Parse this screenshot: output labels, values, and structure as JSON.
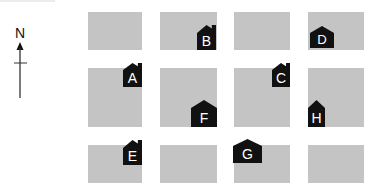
{
  "compass": {
    "label": "N",
    "direction": "north"
  },
  "colors": {
    "block": "#c4c4c4",
    "house": "#111111",
    "house_label": "#ffffff",
    "background": "#ffffff"
  },
  "blocks": [
    {
      "row": 1,
      "col": 1,
      "x": 88,
      "y": 12,
      "w": 54,
      "h": 38
    },
    {
      "row": 1,
      "col": 2,
      "x": 160,
      "y": 12,
      "w": 57,
      "h": 38
    },
    {
      "row": 1,
      "col": 3,
      "x": 234,
      "y": 12,
      "w": 56,
      "h": 38
    },
    {
      "row": 1,
      "col": 4,
      "x": 308,
      "y": 12,
      "w": 56,
      "h": 38
    },
    {
      "row": 2,
      "col": 1,
      "x": 88,
      "y": 68,
      "w": 54,
      "h": 59
    },
    {
      "row": 2,
      "col": 2,
      "x": 160,
      "y": 68,
      "w": 57,
      "h": 59
    },
    {
      "row": 2,
      "col": 3,
      "x": 234,
      "y": 68,
      "w": 56,
      "h": 59
    },
    {
      "row": 2,
      "col": 4,
      "x": 308,
      "y": 68,
      "w": 56,
      "h": 59
    },
    {
      "row": 3,
      "col": 1,
      "x": 88,
      "y": 145,
      "w": 54,
      "h": 38
    },
    {
      "row": 3,
      "col": 2,
      "x": 160,
      "y": 145,
      "w": 57,
      "h": 38
    },
    {
      "row": 3,
      "col": 3,
      "x": 234,
      "y": 145,
      "w": 56,
      "h": 38
    },
    {
      "row": 3,
      "col": 4,
      "x": 308,
      "y": 145,
      "w": 56,
      "h": 38
    }
  ],
  "houses": [
    {
      "label": "A",
      "x": 123,
      "y": 63,
      "w": 19,
      "h": 24,
      "chimney": true
    },
    {
      "label": "B",
      "x": 197,
      "y": 25,
      "w": 19,
      "h": 25,
      "chimney": true
    },
    {
      "label": "C",
      "x": 272,
      "y": 63,
      "w": 18,
      "h": 24,
      "chimney": true
    },
    {
      "label": "D",
      "x": 310,
      "y": 26,
      "w": 24,
      "h": 22,
      "chimney": false
    },
    {
      "label": "E",
      "x": 123,
      "y": 140,
      "w": 19,
      "h": 25,
      "chimney": true
    },
    {
      "label": "F",
      "x": 191,
      "y": 100,
      "w": 26,
      "h": 27,
      "chimney": false
    },
    {
      "label": "G",
      "x": 233,
      "y": 139,
      "w": 29,
      "h": 24,
      "chimney": false
    },
    {
      "label": "H",
      "x": 308,
      "y": 100,
      "w": 17,
      "h": 27,
      "chimney": false
    }
  ]
}
